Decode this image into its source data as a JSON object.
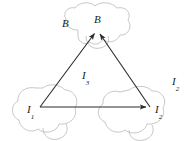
{
  "figure": {
    "type": "physics-diagram",
    "background_color": "#ffffff",
    "line_color": "#2b2b2b",
    "cloud_color": "#b9b9b9"
  },
  "labels": {
    "field_outer": {
      "base": "B",
      "sub": ""
    },
    "field_apex": {
      "base": "B",
      "sub": ""
    },
    "current_left_vertex": {
      "base": "I",
      "sub": "1"
    },
    "current_right_vertex": {
      "base": "I",
      "sub": "2"
    },
    "current_center": {
      "base": "I",
      "sub": "3"
    },
    "current_left_outer": {
      "base": "I",
      "sub": "1"
    },
    "current_right_outer": {
      "base": "I",
      "sub": "2"
    }
  },
  "vertices": {
    "apex": {
      "x": 97,
      "y": 30
    },
    "left": {
      "x": 40,
      "y": 107
    },
    "right": {
      "x": 150,
      "y": 107
    }
  },
  "arrows": [
    {
      "name": "left-to-apex",
      "from": "left",
      "to": "apex"
    },
    {
      "name": "right-to-apex",
      "from": "right",
      "to": "apex"
    },
    {
      "name": "left-to-right",
      "from": "left",
      "to": "right"
    }
  ]
}
